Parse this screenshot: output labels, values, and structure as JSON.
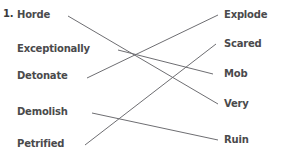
{
  "question": {
    "number": "1.",
    "type": "matching-exercise"
  },
  "style": {
    "text_color": "#4a4a4c",
    "line_color": "#6e6e72",
    "background": "#ffffff"
  },
  "left_column": [
    {
      "id": "horde",
      "label": "Horde",
      "x": 17,
      "y": 9,
      "anchor_x": 68,
      "anchor_y": 16
    },
    {
      "id": "exceptionally",
      "label": "Exceptionally",
      "x": 17,
      "y": 43,
      "anchor_x": 118,
      "anchor_y": 50
    },
    {
      "id": "detonate",
      "label": "Detonate",
      "x": 17,
      "y": 70,
      "anchor_x": 87,
      "anchor_y": 78
    },
    {
      "id": "demolish",
      "label": "Demolish",
      "x": 17,
      "y": 106,
      "anchor_x": 92,
      "anchor_y": 113
    },
    {
      "id": "petrified",
      "label": "Petrified",
      "x": 17,
      "y": 138,
      "anchor_x": 85,
      "anchor_y": 145
    }
  ],
  "right_column": [
    {
      "id": "explode",
      "label": "Explode",
      "x": 224,
      "y": 9,
      "anchor_x": 218,
      "anchor_y": 15
    },
    {
      "id": "scared",
      "label": "Scared",
      "x": 224,
      "y": 38,
      "anchor_x": 216,
      "anchor_y": 44
    },
    {
      "id": "mob",
      "label": "Mob",
      "x": 224,
      "y": 68,
      "anchor_x": 213,
      "anchor_y": 74
    },
    {
      "id": "very",
      "label": "Very",
      "x": 224,
      "y": 98,
      "anchor_x": 218,
      "anchor_y": 104
    },
    {
      "id": "ruin",
      "label": "Ruin",
      "x": 224,
      "y": 134,
      "anchor_x": 218,
      "anchor_y": 140
    }
  ],
  "connections": [
    {
      "id": "line-horde-very",
      "from": "horde",
      "to": "very",
      "x1": 68,
      "y1": 16,
      "x2": 218,
      "y2": 104
    },
    {
      "id": "line-exceptionally-mob",
      "from": "exceptionally",
      "to": "mob",
      "x1": 118,
      "y1": 50,
      "x2": 213,
      "y2": 74
    },
    {
      "id": "line-detonate-explode",
      "from": "detonate",
      "to": "explode",
      "x1": 87,
      "y1": 78,
      "x2": 218,
      "y2": 15
    },
    {
      "id": "line-demolish-ruin",
      "from": "demolish",
      "to": "ruin",
      "x1": 92,
      "y1": 113,
      "x2": 218,
      "y2": 140
    },
    {
      "id": "line-petrified-scared",
      "from": "petrified",
      "to": "scared",
      "x1": 85,
      "y1": 145,
      "x2": 216,
      "y2": 44
    }
  ]
}
